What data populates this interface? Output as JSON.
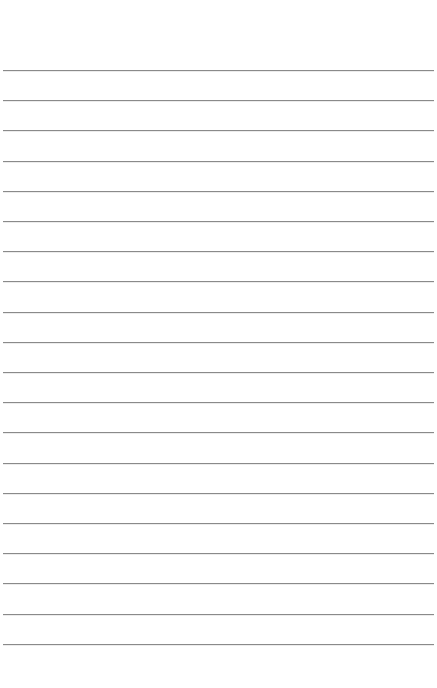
{
  "page": {
    "type": "lined-notepad-sheet",
    "background_color": "#ffffff",
    "rule_color": "#8a8a8a",
    "rule_count": 20,
    "first_rule_y": 70,
    "rule_spacing": 30.2,
    "text": ""
  }
}
